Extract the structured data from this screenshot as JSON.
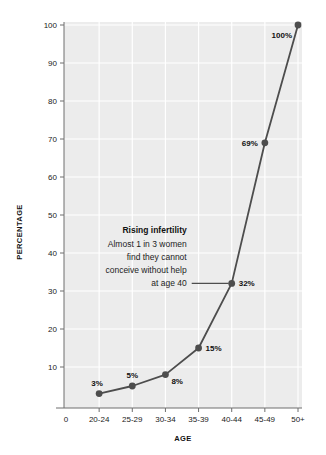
{
  "chart_data": {
    "type": "line",
    "title": "",
    "xlabel": "AGE",
    "ylabel": "PERCENTAGE",
    "categories": [
      "20-24",
      "25-29",
      "30-34",
      "35-39",
      "40-44",
      "45-49",
      "50+"
    ],
    "values": [
      3,
      5,
      8,
      15,
      32,
      69,
      100
    ],
    "point_labels": [
      "3%",
      "5%",
      "8%",
      "15%",
      "32%",
      "69%",
      "100%"
    ],
    "ylim": [
      0,
      100
    ],
    "yticks": [
      10,
      20,
      30,
      40,
      50,
      60,
      70,
      80,
      90,
      100
    ],
    "ytick_labels": [
      "10",
      "20",
      "30",
      "40",
      "50",
      "60",
      "70",
      "80",
      "90",
      "100"
    ],
    "xtick_labels": [
      "0",
      "20-24",
      "25-29",
      "30-34",
      "35-39",
      "40-44",
      "45-49",
      "50+"
    ],
    "grid": true,
    "legend": "none",
    "series_color": "#4d4d4d",
    "plot_background": "#ececec",
    "gridline_color": "#ffffff",
    "annotations": [
      {
        "title": "Rising infertility",
        "lines": [
          "Almost 1 in 3 women",
          "find they cannot",
          "conceive without help",
          "at age 40"
        ],
        "points_to": "40-44",
        "points_to_value": 32
      }
    ]
  }
}
